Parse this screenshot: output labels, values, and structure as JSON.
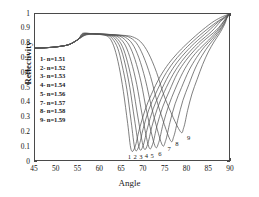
{
  "chart_data": {
    "type": "line",
    "title": "",
    "xlabel": "Angle",
    "ylabel": "Reflectivity",
    "xlim": [
      45,
      90
    ],
    "ylim": [
      0,
      1
    ],
    "xticks": [
      45,
      50,
      55,
      60,
      65,
      70,
      75,
      80,
      85,
      90
    ],
    "yticks": [
      0,
      0.1,
      0.2,
      0.3,
      0.4,
      0.5,
      0.6,
      0.7,
      0.8,
      0.9,
      1
    ],
    "grid": false,
    "legend_position": "left-inner",
    "line_color": "#555555",
    "series": [
      {
        "name": "1",
        "n": 1.51,
        "legend": "1- n=1.51",
        "min_angle": 67.3,
        "min_value": 0.07,
        "x": [
          45,
          47,
          49,
          51,
          53,
          55,
          55.8,
          56.4,
          57.5,
          59,
          60.5,
          61.5,
          62.5,
          63.5,
          64.5,
          65.5,
          66.5,
          67.3,
          68.2,
          69.2,
          70.5,
          72,
          74,
          76,
          78,
          80,
          83,
          86,
          88,
          90
        ],
        "y": [
          0.766,
          0.768,
          0.772,
          0.779,
          0.792,
          0.826,
          0.862,
          0.869,
          0.866,
          0.862,
          0.858,
          0.852,
          0.828,
          0.76,
          0.64,
          0.47,
          0.25,
          0.07,
          0.09,
          0.21,
          0.34,
          0.45,
          0.57,
          0.66,
          0.73,
          0.79,
          0.87,
          0.94,
          0.975,
          1.0
        ]
      },
      {
        "name": "2",
        "n": 1.52,
        "legend": "2- n=1.52",
        "min_angle": 68.2,
        "min_value": 0.075,
        "x": [
          45,
          47,
          49,
          51,
          53,
          55,
          55.9,
          56.6,
          57.8,
          59.3,
          60.8,
          62,
          63,
          64.2,
          65.2,
          66.3,
          67.3,
          68.2,
          69.1,
          70.1,
          71.4,
          73,
          75,
          77,
          79,
          81,
          84,
          87,
          88.6,
          90
        ],
        "y": [
          0.766,
          0.768,
          0.772,
          0.779,
          0.792,
          0.826,
          0.861,
          0.868,
          0.866,
          0.862,
          0.858,
          0.852,
          0.83,
          0.765,
          0.65,
          0.485,
          0.265,
          0.075,
          0.095,
          0.215,
          0.345,
          0.455,
          0.575,
          0.665,
          0.735,
          0.795,
          0.873,
          0.942,
          0.972,
          1.0
        ]
      },
      {
        "name": "3",
        "n": 1.53,
        "legend": "3- n=1.53",
        "min_angle": 69.2,
        "min_value": 0.08,
        "x": [
          45,
          47,
          49,
          51,
          53,
          55,
          56,
          56.8,
          58,
          59.6,
          61.1,
          62.4,
          63.5,
          64.8,
          65.9,
          67,
          68.1,
          69.2,
          70.1,
          71.1,
          72.4,
          74,
          76,
          78,
          80,
          82,
          85,
          87.5,
          89,
          90
        ],
        "y": [
          0.766,
          0.768,
          0.772,
          0.779,
          0.792,
          0.826,
          0.86,
          0.867,
          0.866,
          0.862,
          0.858,
          0.852,
          0.832,
          0.77,
          0.658,
          0.495,
          0.275,
          0.08,
          0.1,
          0.22,
          0.35,
          0.46,
          0.58,
          0.67,
          0.74,
          0.8,
          0.878,
          0.945,
          0.975,
          1.0
        ]
      },
      {
        "name": "4",
        "n": 1.54,
        "legend": "4- n=1.54",
        "min_angle": 70.2,
        "min_value": 0.085,
        "x": [
          45,
          47,
          49,
          51,
          53,
          55,
          56.1,
          57,
          58.2,
          59.9,
          61.4,
          62.8,
          64,
          65.3,
          66.5,
          67.7,
          68.9,
          70.2,
          71.1,
          72.1,
          73.4,
          75,
          77,
          79,
          81,
          83,
          86,
          88,
          89.2,
          90
        ],
        "y": [
          0.766,
          0.768,
          0.772,
          0.779,
          0.792,
          0.826,
          0.859,
          0.866,
          0.866,
          0.862,
          0.858,
          0.853,
          0.834,
          0.776,
          0.666,
          0.505,
          0.288,
          0.085,
          0.105,
          0.228,
          0.355,
          0.468,
          0.585,
          0.675,
          0.745,
          0.805,
          0.882,
          0.948,
          0.978,
          1.0
        ]
      },
      {
        "name": "5",
        "n": 1.56,
        "legend": "5- n=1.56",
        "min_angle": 71.4,
        "min_value": 0.09,
        "x": [
          45,
          47,
          49,
          51,
          53,
          55,
          56.2,
          57.2,
          58.5,
          60.2,
          61.8,
          63.3,
          64.6,
          66,
          67.3,
          68.6,
          69.9,
          71.4,
          72.3,
          73.3,
          74.6,
          76.2,
          78,
          80,
          82,
          84,
          87,
          88.8,
          89.5,
          90
        ],
        "y": [
          0.766,
          0.768,
          0.772,
          0.779,
          0.792,
          0.826,
          0.858,
          0.865,
          0.865,
          0.862,
          0.858,
          0.853,
          0.836,
          0.782,
          0.676,
          0.518,
          0.302,
          0.09,
          0.11,
          0.235,
          0.362,
          0.475,
          0.592,
          0.682,
          0.752,
          0.812,
          0.888,
          0.952,
          0.98,
          1.0
        ]
      },
      {
        "name": "6",
        "n": 1.55,
        "legend": "",
        "min_angle": 72.8,
        "min_value": 0.098,
        "x": [
          45,
          47,
          49,
          51,
          53,
          55,
          56.3,
          57.4,
          58.8,
          60.6,
          62.3,
          63.9,
          65.3,
          66.8,
          68.2,
          69.6,
          71,
          72.8,
          73.7,
          74.7,
          76,
          77.5,
          79.3,
          81.2,
          83.2,
          85.3,
          87.6,
          89,
          89.6,
          90
        ],
        "y": [
          0.766,
          0.768,
          0.772,
          0.779,
          0.792,
          0.826,
          0.857,
          0.864,
          0.865,
          0.862,
          0.858,
          0.853,
          0.838,
          0.788,
          0.688,
          0.533,
          0.32,
          0.098,
          0.12,
          0.245,
          0.372,
          0.485,
          0.6,
          0.692,
          0.762,
          0.822,
          0.897,
          0.957,
          0.982,
          1.0
        ]
      },
      {
        "name": "7",
        "n": 1.57,
        "legend": "7- n=1.57",
        "min_angle": 74.4,
        "min_value": 0.11,
        "x": [
          45,
          47,
          49,
          51,
          53,
          55,
          56.4,
          57.6,
          59.1,
          61,
          62.8,
          64.5,
          66,
          67.6,
          69.1,
          70.6,
          72.2,
          74.4,
          75.3,
          76.3,
          77.5,
          79,
          80.7,
          82.5,
          84.3,
          86.2,
          88.2,
          89.3,
          89.7,
          90
        ],
        "y": [
          0.766,
          0.768,
          0.772,
          0.779,
          0.792,
          0.826,
          0.856,
          0.863,
          0.864,
          0.862,
          0.858,
          0.853,
          0.84,
          0.795,
          0.7,
          0.55,
          0.342,
          0.11,
          0.132,
          0.258,
          0.385,
          0.497,
          0.612,
          0.703,
          0.775,
          0.835,
          0.908,
          0.962,
          0.984,
          1.0
        ]
      },
      {
        "name": "8",
        "n": 1.58,
        "legend": "8- n=1.58",
        "min_angle": 76.3,
        "min_value": 0.14,
        "x": [
          45,
          47,
          49,
          51,
          53,
          55,
          56.5,
          57.8,
          59.4,
          61.4,
          63.3,
          65.1,
          66.8,
          68.5,
          70.1,
          71.8,
          73.6,
          76.3,
          77.2,
          78.2,
          79.3,
          80.7,
          82.2,
          83.8,
          85.4,
          87,
          88.6,
          89.4,
          89.8,
          90
        ],
        "y": [
          0.766,
          0.768,
          0.772,
          0.779,
          0.792,
          0.826,
          0.855,
          0.862,
          0.864,
          0.861,
          0.858,
          0.853,
          0.842,
          0.802,
          0.714,
          0.572,
          0.372,
          0.14,
          0.162,
          0.285,
          0.408,
          0.518,
          0.63,
          0.718,
          0.788,
          0.848,
          0.918,
          0.968,
          0.986,
          1.0
        ]
      },
      {
        "name": "9",
        "n": 1.59,
        "legend": "9- n=1.59",
        "min_angle": 78.6,
        "min_value": 0.2,
        "x": [
          45,
          47,
          49,
          51,
          53,
          55,
          56.6,
          58,
          59.7,
          61.8,
          63.8,
          65.8,
          67.6,
          69.5,
          71.3,
          73.2,
          75.3,
          78.6,
          79.5,
          80.4,
          81.4,
          82.6,
          83.9,
          85.2,
          86.5,
          87.8,
          89,
          89.5,
          89.8,
          90
        ],
        "y": [
          0.766,
          0.768,
          0.772,
          0.779,
          0.792,
          0.826,
          0.854,
          0.861,
          0.863,
          0.861,
          0.857,
          0.853,
          0.844,
          0.81,
          0.732,
          0.6,
          0.412,
          0.2,
          0.222,
          0.34,
          0.452,
          0.552,
          0.655,
          0.74,
          0.808,
          0.866,
          0.93,
          0.972,
          0.988,
          1.0
        ]
      }
    ],
    "curve_tags": [
      {
        "label": "1",
        "x": 67.0,
        "y": 0.022
      },
      {
        "label": "2",
        "x": 68.3,
        "y": 0.022
      },
      {
        "label": "3",
        "x": 69.6,
        "y": 0.022
      },
      {
        "label": "4",
        "x": 70.9,
        "y": 0.026
      },
      {
        "label": "5",
        "x": 72.2,
        "y": 0.03
      },
      {
        "label": "6",
        "x": 74.0,
        "y": 0.042
      },
      {
        "label": "7",
        "x": 76.1,
        "y": 0.075
      },
      {
        "label": "8",
        "x": 77.9,
        "y": 0.105
      },
      {
        "label": "9",
        "x": 80.6,
        "y": 0.15
      }
    ]
  },
  "axes": {
    "xlabel": "Angle",
    "ylabel": "Reflectivity",
    "xticks": [
      "45",
      "50",
      "55",
      "60",
      "65",
      "70",
      "75",
      "80",
      "85",
      "90"
    ],
    "yticks": [
      "1",
      "0.9",
      "0.8",
      "0.7",
      "0.6",
      "0.5",
      "0.4",
      "0.3",
      "0.2",
      "0.1",
      "0"
    ]
  },
  "legend": {
    "entries": [
      "1- n=1.51",
      "2- n=1.52",
      "3- n=1.53",
      "4- n=1.54",
      "5- n=1.56",
      "7- n=1.57",
      "8- n=1.58",
      "9- n=1.59"
    ]
  }
}
